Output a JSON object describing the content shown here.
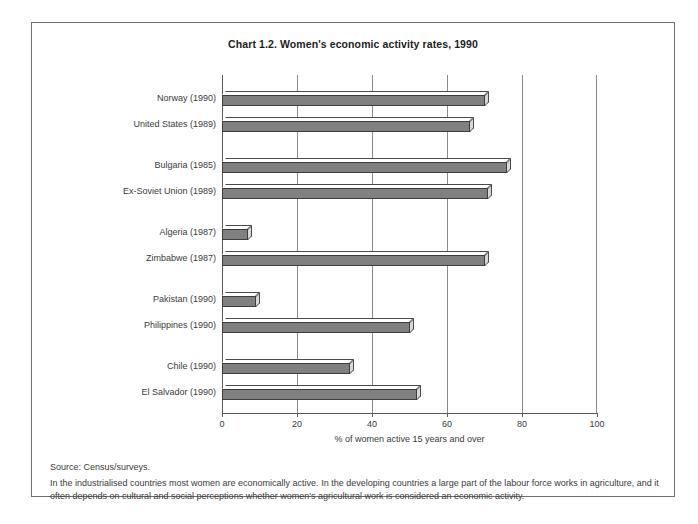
{
  "chart_data": {
    "type": "bar",
    "orientation": "horizontal",
    "title": "Chart 1.2.   Women's economic activity rates, 1990",
    "xlabel": "% of women active 15 years and over",
    "ylabel": "",
    "xlim": [
      0,
      100
    ],
    "xticks": [
      0,
      20,
      40,
      60,
      80,
      100
    ],
    "grid": true,
    "grid_axis": "x",
    "legend": "none",
    "bar_color": "#808080",
    "categories": [
      "Norway (1990)",
      "United States (1989)",
      "Bulgaria (1985)",
      "Ex-Soviet Union (1989)",
      "Algeria (1987)",
      "Zimbabwe (1987)",
      "Pakistan (1990)",
      "Philippines (1990)",
      "Chile (1990)",
      "El Salvador (1990)"
    ],
    "values": [
      70,
      66,
      76,
      71,
      7,
      70,
      9,
      50,
      34,
      52
    ],
    "groups": [
      {
        "name": "industrialised",
        "categories": [
          "Norway (1990)",
          "United States (1989)"
        ]
      },
      {
        "name": "transition",
        "categories": [
          "Bulgaria (1985)",
          "Ex-Soviet Union (1989)"
        ]
      },
      {
        "name": "africa",
        "categories": [
          "Algeria (1987)",
          "Zimbabwe (1987)"
        ]
      },
      {
        "name": "asia",
        "categories": [
          "Pakistan (1990)",
          "Philippines (1990)"
        ]
      },
      {
        "name": "latin-america",
        "categories": [
          "Chile (1990)",
          "El Salvador (1990)"
        ]
      }
    ]
  },
  "footer": {
    "source": "Source: Census/surveys.",
    "note": "In the industrialised countries most women are economically active. In the developing countries a large part of the labour force works in agriculture, and it often depends on cultural and social perceptions whether women's agricultural work is considered an economic activity."
  }
}
